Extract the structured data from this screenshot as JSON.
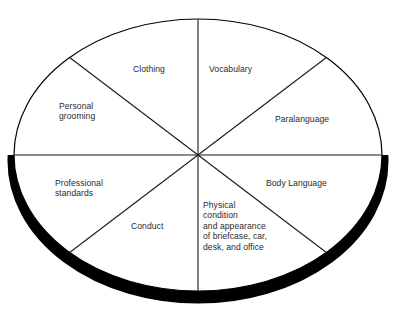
{
  "diagram": {
    "name": "professional-image-wheel",
    "shape": "circle-divided-into-eight-segments",
    "background_color": "#ffffff",
    "outline_color": "#000000",
    "shadow_color": "#000000",
    "text_color": "#2b2b2b",
    "geometry": {
      "center_x": 198,
      "center_y": 155,
      "radius_x": 184,
      "radius_y": 136,
      "divider_count": 4,
      "segment_count": 8
    },
    "segments": [
      {
        "id": "clothing",
        "label": "Clothing"
      },
      {
        "id": "vocabulary",
        "label": "Vocabulary"
      },
      {
        "id": "personal-grooming",
        "label": "Personal\ngrooming"
      },
      {
        "id": "paralanguage",
        "label": "Paralanguage"
      },
      {
        "id": "professional-standards",
        "label": "Professional\nstandards"
      },
      {
        "id": "body-language",
        "label": "Body Language"
      },
      {
        "id": "conduct",
        "label": "Conduct"
      },
      {
        "id": "physical-condition",
        "label": "Physical\ncondition\nand appearance\nof briefcase, car,\ndesk, and office"
      }
    ]
  }
}
